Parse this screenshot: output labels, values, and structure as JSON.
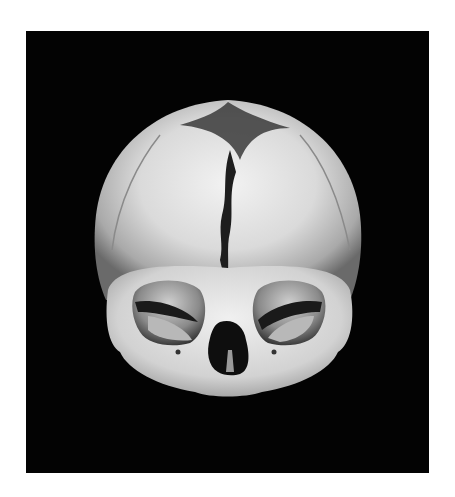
{
  "image": {
    "subject": "infant skull, anterior view",
    "background_color": "#030303",
    "border_color": "#ffffff",
    "bone_color": "#e4e4e4",
    "shadow_color": "#1a1a1a"
  }
}
